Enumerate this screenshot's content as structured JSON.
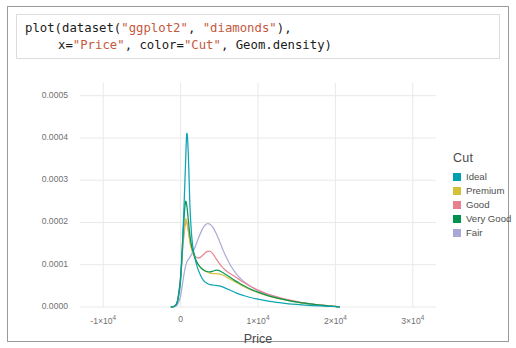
{
  "code_cell": {
    "lines": [
      [
        {
          "t": "plot(dataset(",
          "k": "plain"
        },
        {
          "t": "\"ggplot2\"",
          "k": "str"
        },
        {
          "t": ", ",
          "k": "plain"
        },
        {
          "t": "\"diamonds\"",
          "k": "str"
        },
        {
          "t": "),",
          "k": "plain"
        }
      ],
      [
        {
          "t": "x=",
          "k": "plain"
        },
        {
          "t": "\"Price\"",
          "k": "str"
        },
        {
          "t": ", color=",
          "k": "plain"
        },
        {
          "t": "\"Cut\"",
          "k": "str"
        },
        {
          "t": ", Geom.density)",
          "k": "plain"
        }
      ]
    ],
    "string_color": "#c4593f",
    "plain_color": "#1b1b1b"
  },
  "legend": {
    "title": "Cut",
    "entries": [
      {
        "label": "Ideal",
        "color": "#00a0b0"
      },
      {
        "label": "Premium",
        "color": "#d4c138"
      },
      {
        "label": "Good",
        "color": "#e8808f"
      },
      {
        "label": "Very Good",
        "color": "#00914e"
      },
      {
        "label": "Fair",
        "color": "#a9a8d4"
      }
    ]
  },
  "chart_data": {
    "type": "line",
    "title": "",
    "xlabel": "Price",
    "ylabel": "",
    "xlim": [
      -13000,
      33000
    ],
    "ylim": [
      0,
      0.00053
    ],
    "grid": true,
    "legend_position": "right",
    "xticks": [
      {
        "value": -10000,
        "label": "-1×10",
        "exp": "4"
      },
      {
        "value": 0,
        "label": "0",
        "exp": ""
      },
      {
        "value": 10000,
        "label": "1×10",
        "exp": "4"
      },
      {
        "value": 20000,
        "label": "2×10",
        "exp": "4"
      },
      {
        "value": 30000,
        "label": "3×10",
        "exp": "4"
      }
    ],
    "yticks": [
      {
        "value": 0.0,
        "label": "0.0000"
      },
      {
        "value": 0.0001,
        "label": "0.0001"
      },
      {
        "value": 0.0002,
        "label": "0.0002"
      },
      {
        "value": 0.0003,
        "label": "0.0003"
      },
      {
        "value": 0.0004,
        "label": "0.0004"
      },
      {
        "value": 0.0005,
        "label": "0.0005"
      }
    ],
    "x": [
      -1200,
      -800,
      -400,
      0,
      300,
      600,
      800,
      1000,
      1200,
      1400,
      1600,
      1900,
      2200,
      2600,
      3000,
      3400,
      3800,
      4200,
      4600,
      5000,
      5500,
      6000,
      6500,
      7000,
      7500,
      8000,
      9000,
      10000,
      11000,
      12000,
      13000,
      14000,
      15000,
      16000,
      17000,
      18000,
      19000,
      20000,
      20500
    ],
    "series": [
      {
        "name": "Ideal",
        "color": "#00a0b0",
        "values": [
          0.0,
          2e-06,
          1.2e-05,
          6.2e-05,
          0.00017,
          0.00032,
          0.00041,
          0.00036,
          0.00024,
          0.000175,
          0.00014,
          0.000112,
          9.2e-05,
          7.4e-05,
          6.2e-05,
          5.6e-05,
          5.3e-05,
          5.2e-05,
          5.1e-05,
          5e-05,
          4.7e-05,
          4.3e-05,
          3.9e-05,
          3.5e-05,
          3.1e-05,
          2.8e-05,
          2.25e-05,
          1.85e-05,
          1.5e-05,
          1.2e-05,
          9.6e-06,
          7.6e-06,
          6e-06,
          4.6e-06,
          3.4e-06,
          2.4e-06,
          1.6e-06,
          8e-07,
          0.0
        ]
      },
      {
        "name": "Premium",
        "color": "#d4c138",
        "values": [
          0.0,
          2e-06,
          1.4e-05,
          6.8e-05,
          0.00015,
          0.000205,
          0.000202,
          0.000182,
          0.000156,
          0.000138,
          0.000126,
          0.000112,
          0.000102,
          9.3e-05,
          8.7e-05,
          8.3e-05,
          8e-05,
          7.9e-05,
          7.9e-05,
          7.8e-05,
          7.5e-05,
          7e-05,
          6.5e-05,
          6e-05,
          5.5e-05,
          5e-05,
          4.1e-05,
          3.4e-05,
          2.8e-05,
          2.3e-05,
          1.85e-05,
          1.48e-05,
          1.16e-05,
          8.8e-06,
          6.5e-06,
          4.5e-06,
          2.8e-06,
          1.2e-06,
          0.0
        ]
      },
      {
        "name": "Good",
        "color": "#e8808f",
        "values": [
          0.0,
          2.2e-06,
          1.5e-05,
          7e-05,
          0.000145,
          0.000195,
          0.0002,
          0.00018,
          0.000156,
          0.00014,
          0.00013,
          0.00012,
          0.000116,
          0.000118,
          0.000125,
          0.000131,
          0.000132,
          0.000125,
          0.000114,
          0.000103,
          9.2e-05,
          8.4e-05,
          7.8e-05,
          7.2e-05,
          6.6e-05,
          6e-05,
          4.9e-05,
          4e-05,
          3.25e-05,
          2.62e-05,
          2.1e-05,
          1.66e-05,
          1.28e-05,
          9.6e-06,
          7e-06,
          4.8e-06,
          3e-06,
          1.3e-06,
          0.0
        ]
      },
      {
        "name": "Very Good",
        "color": "#00914e",
        "values": [
          0.0,
          2.2e-06,
          1.45e-05,
          7.2e-05,
          0.00017,
          0.000245,
          0.00024,
          0.000205,
          0.00017,
          0.000146,
          0.000132,
          0.000115,
          0.000103,
          9.3e-05,
          8.7e-05,
          8.4e-05,
          8.3e-05,
          8.5e-05,
          8.7e-05,
          8.6e-05,
          8.1e-05,
          7.5e-05,
          6.9e-05,
          6.3e-05,
          5.75e-05,
          5.2e-05,
          4.25e-05,
          3.5e-05,
          2.88e-05,
          2.35e-05,
          1.9e-05,
          1.52e-05,
          1.19e-05,
          9e-06,
          6.6e-06,
          4.6e-06,
          2.9e-06,
          1.3e-06,
          0.0
        ]
      },
      {
        "name": "Fair",
        "color": "#a9a8d4",
        "values": [
          0.0,
          1e-06,
          5.5e-06,
          2.6e-05,
          6.2e-05,
          9.3e-05,
          0.000106,
          0.000113,
          0.000118,
          0.000124,
          0.000131,
          0.000143,
          0.000158,
          0.000176,
          0.00019,
          0.000197,
          0.000196,
          0.000188,
          0.000174,
          0.000157,
          0.000134,
          0.000114,
          9.7e-05,
          8.3e-05,
          7.2e-05,
          6.3e-05,
          4.9e-05,
          3.9e-05,
          3.12e-05,
          2.5e-05,
          2e-05,
          1.58e-05,
          1.23e-05,
          9.3e-06,
          6.8e-06,
          4.7e-06,
          2.9e-06,
          1.3e-06,
          0.0
        ]
      }
    ]
  }
}
